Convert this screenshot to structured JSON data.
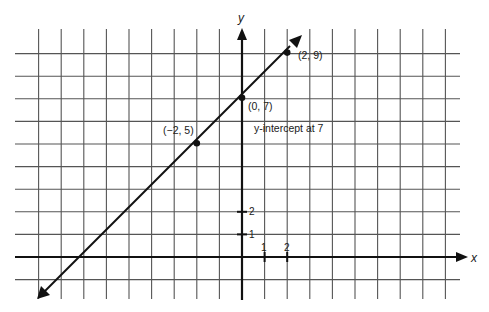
{
  "chart_data": {
    "type": "line",
    "title": "",
    "xlabel": "x",
    "ylabel": "y",
    "grid": true,
    "xlim": [
      -9,
      9
    ],
    "ylim": [
      -2,
      10
    ],
    "x_ticks_labeled": [
      1,
      2
    ],
    "y_ticks_labeled": [
      1,
      2
    ],
    "series": [
      {
        "name": "y = x + 7",
        "slope": 1,
        "intercept": 7,
        "x_range": [
          -8.8,
          2.2
        ]
      }
    ],
    "points": [
      {
        "x": -2,
        "y": 5,
        "label": "(−2, 5)"
      },
      {
        "x": 0,
        "y": 7,
        "label": "(0, 7)"
      },
      {
        "x": 2,
        "y": 9,
        "label": "(2, 9)"
      }
    ],
    "annotations": [
      {
        "text": "y-intercept at 7",
        "x": 0.5,
        "y": 5.6
      }
    ],
    "colors": {
      "line": "#111111",
      "grid": "#555555",
      "axis": "#111111"
    }
  },
  "labels": {
    "x_axis": "x",
    "y_axis": "y",
    "tick_x1": "1",
    "tick_x2": "2",
    "tick_y1": "1",
    "tick_y2": "2",
    "p1": "(−2, 5)",
    "p2": "(0, 7)",
    "p3": "(2, 9)",
    "annotation": "y-intercept at 7"
  }
}
